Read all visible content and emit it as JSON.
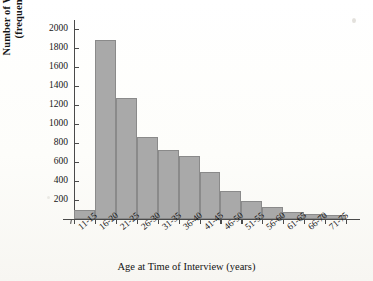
{
  "chart_data": {
    "type": "bar",
    "title": "",
    "xlabel": "Age at Time of Interview (years)",
    "ylabel_lines": [
      "Number of Women",
      "(frequency)"
    ],
    "categories": [
      "11-15",
      "16-20",
      "21-25",
      "26-30",
      "31-35",
      "36-40",
      "41-45",
      "46-50",
      "51-55",
      "56-60",
      "61-65",
      "66-70",
      "71-75"
    ],
    "values": [
      100,
      1880,
      1270,
      860,
      730,
      660,
      490,
      300,
      190,
      130,
      70,
      50,
      40
    ],
    "ylim": [
      0,
      2100
    ],
    "yticks": [
      200,
      400,
      600,
      800,
      1000,
      1200,
      1400,
      1600,
      1800,
      2000
    ],
    "ytick_labels": [
      "200",
      "400",
      "600",
      "800",
      "1000",
      "1200",
      "1400",
      "1600",
      "1800",
      "2000"
    ],
    "grid": false,
    "legend": false,
    "bar_color": "#a9a9a9",
    "bar_edge_color": "#8a8a8a",
    "axis_color": "#4a4a4a",
    "background_color": "#fdfdfb"
  }
}
